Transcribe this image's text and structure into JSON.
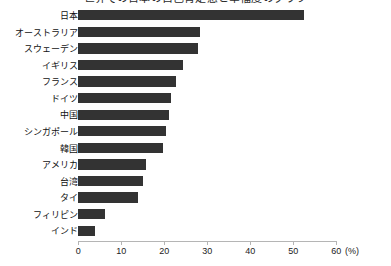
{
  "chart_data": {
    "type": "bar",
    "orientation": "horizontal",
    "title": "世界での日本の自己肯定感と幸福度のグラフ",
    "xlabel": "(%)",
    "ylabel": "",
    "xlim": [
      0,
      60
    ],
    "xticks": [
      0,
      10,
      20,
      30,
      40,
      50,
      60
    ],
    "grid": false,
    "legend": "none",
    "bar_color": "#333333",
    "axis_color": "#b5b5b5",
    "categories": [
      "日本",
      "オーストラリア",
      "スウェーデン",
      "イギリス",
      "フランス",
      "ドイツ",
      "中国",
      "シンガポール",
      "韓国",
      "アメリカ",
      "台湾",
      "タイ",
      "フィリピン",
      "インド"
    ],
    "values": [
      52.5,
      28.3,
      27.8,
      24.3,
      22.8,
      21.5,
      21.0,
      20.4,
      19.6,
      15.8,
      15.0,
      13.9,
      6.2,
      3.8
    ]
  }
}
